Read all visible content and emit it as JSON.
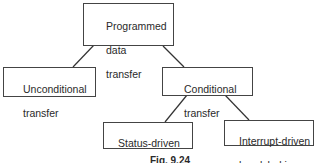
{
  "diagram": {
    "type": "tree",
    "nodes": {
      "root": {
        "id": "programmed-data-transfer",
        "lines": [
          "Programmed",
          "data",
          "transfer"
        ]
      },
      "unconditional": {
        "id": "unconditional-transfer",
        "lines": [
          "Unconditional",
          "transfer"
        ]
      },
      "conditional": {
        "id": "conditional-transfer",
        "lines": [
          "Conditional",
          "transfer"
        ]
      },
      "status_driven": {
        "id": "status-driven-handshaking",
        "lines": [
          "Status-driven",
          "handshaking"
        ]
      },
      "interrupt_driven": {
        "id": "interrupt-driven-handshaking",
        "lines": [
          "Interrupt-driven",
          "handshaking"
        ]
      }
    },
    "edges": [
      {
        "from": "programmed-data-transfer",
        "to": "unconditional-transfer"
      },
      {
        "from": "programmed-data-transfer",
        "to": "conditional-transfer"
      },
      {
        "from": "conditional-transfer",
        "to": "status-driven-handshaking"
      },
      {
        "from": "conditional-transfer",
        "to": "interrupt-driven-handshaking"
      }
    ],
    "caption": "Fig. 9.24"
  }
}
